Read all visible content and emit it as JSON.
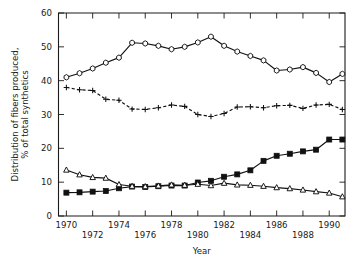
{
  "chart_data": {
    "type": "line",
    "title": "",
    "xlabel": "Year",
    "ylabel": "Distribution of fibers produced,\n% of total synthetics",
    "ylabel_line1": "Distribution of fibers produced,",
    "ylabel_line2": "% of total synthetics",
    "xlim": [
      1969.4,
      1991.2
    ],
    "ylim": [
      0,
      60
    ],
    "grid": false,
    "legend": "none",
    "yticks": [
      0,
      10,
      20,
      30,
      40,
      50,
      60
    ],
    "yticklabels": [
      "0",
      "10",
      "20",
      "30",
      "40",
      "50",
      "60"
    ],
    "xticks": [
      1970,
      1972,
      1974,
      1976,
      1978,
      1980,
      1982,
      1984,
      1986,
      1988,
      1990
    ],
    "xticklabels_upper": [
      "1970",
      "1974",
      "1978",
      "1982",
      "1986",
      "1990"
    ],
    "xticklabels_lower": [
      "1972",
      "1976",
      "1980",
      "1984",
      "1988"
    ],
    "x": [
      1970,
      1971,
      1972,
      1973,
      1974,
      1975,
      1976,
      1977,
      1978,
      1979,
      1980,
      1981,
      1982,
      1983,
      1984,
      1985,
      1986,
      1987,
      1988,
      1989,
      1990,
      1991
    ],
    "series": [
      {
        "name": "polyester",
        "marker": "open-hexagon",
        "linestyle": "solid",
        "values": [
          41.0,
          42.2,
          43.6,
          45.3,
          46.8,
          51.2,
          51.0,
          50.3,
          49.3,
          50.0,
          51.3,
          53.0,
          50.3,
          48.6,
          47.3,
          46.0,
          43.0,
          43.3,
          44.0,
          42.3,
          39.6,
          42.0
        ]
      },
      {
        "name": "nylon",
        "marker": "plus",
        "linestyle": "dashed",
        "values": [
          38.0,
          37.3,
          37.1,
          34.5,
          34.2,
          31.6,
          31.5,
          32.0,
          32.8,
          32.4,
          30.0,
          29.4,
          30.3,
          32.2,
          32.3,
          32.0,
          32.6,
          32.7,
          31.8,
          32.8,
          33.0,
          31.5
        ]
      },
      {
        "name": "olefin",
        "marker": "filled-square",
        "linestyle": "solid",
        "values": [
          6.9,
          7.0,
          7.2,
          7.4,
          8.2,
          8.7,
          8.6,
          8.8,
          9.0,
          9.0,
          9.9,
          10.4,
          11.6,
          12.3,
          13.5,
          16.3,
          17.8,
          18.4,
          19.1,
          19.6,
          22.6,
          22.6
        ]
      },
      {
        "name": "acrylic",
        "marker": "open-triangle",
        "linestyle": "solid",
        "values": [
          13.6,
          12.2,
          11.4,
          11.2,
          9.3,
          8.8,
          8.7,
          8.9,
          9.2,
          9.1,
          9.4,
          9.0,
          9.7,
          9.2,
          9.1,
          8.8,
          8.4,
          8.1,
          7.7,
          7.2,
          6.8,
          5.7
        ]
      }
    ]
  }
}
